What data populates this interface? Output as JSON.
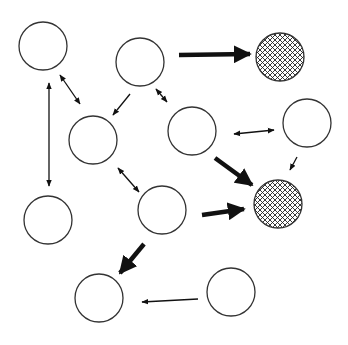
{
  "diagram": {
    "title": "",
    "colors": {
      "stroke": "#333333",
      "arrow": "#111111",
      "background": "#ffffff",
      "hatch": "#222222"
    },
    "nodes": [
      {
        "id": "A",
        "cx": 43,
        "cy": 46,
        "r": 24,
        "style": "empty"
      },
      {
        "id": "B",
        "cx": 140,
        "cy": 62,
        "r": 24,
        "style": "empty"
      },
      {
        "id": "C",
        "cx": 280,
        "cy": 57,
        "r": 24,
        "style": "hatched"
      },
      {
        "id": "D",
        "cx": 93,
        "cy": 140,
        "r": 24,
        "style": "empty"
      },
      {
        "id": "E",
        "cx": 192,
        "cy": 131,
        "r": 24,
        "style": "empty"
      },
      {
        "id": "F",
        "cx": 307,
        "cy": 123,
        "r": 24,
        "style": "empty"
      },
      {
        "id": "G",
        "cx": 278,
        "cy": 204,
        "r": 24,
        "style": "hatched"
      },
      {
        "id": "H",
        "cx": 48,
        "cy": 220,
        "r": 24,
        "style": "empty"
      },
      {
        "id": "I",
        "cx": 162,
        "cy": 210,
        "r": 24,
        "style": "empty"
      },
      {
        "id": "J",
        "cx": 99,
        "cy": 298,
        "r": 24,
        "style": "empty"
      },
      {
        "id": "K",
        "cx": 231,
        "cy": 292,
        "r": 24,
        "style": "empty"
      }
    ],
    "edges": [
      {
        "from": "A",
        "to": "D",
        "x1": 60,
        "y1": 75,
        "x2": 80,
        "y2": 104,
        "weight": "thin",
        "bidirectional": true
      },
      {
        "from": "A",
        "to": "H",
        "x1": 49,
        "y1": 83,
        "x2": 49,
        "y2": 186,
        "weight": "thin",
        "bidirectional": true
      },
      {
        "from": "B",
        "to": "D",
        "x1": 130,
        "y1": 94,
        "x2": 113,
        "y2": 115,
        "weight": "thin",
        "bidirectional": false
      },
      {
        "from": "B",
        "to": "E",
        "x1": 156,
        "y1": 89,
        "x2": 167,
        "y2": 102,
        "weight": "thin",
        "bidirectional": true
      },
      {
        "from": "B",
        "to": "C",
        "x1": 179,
        "y1": 55,
        "x2": 250,
        "y2": 54,
        "weight": "heavy",
        "bidirectional": false
      },
      {
        "from": "E",
        "to": "F",
        "x1": 234,
        "y1": 134,
        "x2": 274,
        "y2": 130,
        "weight": "thin",
        "bidirectional": true
      },
      {
        "from": "F",
        "to": "G",
        "x1": 297,
        "y1": 157,
        "x2": 290,
        "y2": 170,
        "weight": "thin",
        "bidirectional": false
      },
      {
        "from": "E",
        "to": "G",
        "x1": 215,
        "y1": 158,
        "x2": 252,
        "y2": 185,
        "weight": "heavy",
        "bidirectional": false
      },
      {
        "from": "D",
        "to": "I",
        "x1": 118,
        "y1": 168,
        "x2": 139,
        "y2": 192,
        "weight": "thin",
        "bidirectional": true
      },
      {
        "from": "I",
        "to": "G",
        "x1": 202,
        "y1": 215,
        "x2": 244,
        "y2": 209,
        "weight": "heavy",
        "bidirectional": false
      },
      {
        "from": "I",
        "to": "J",
        "x1": 144,
        "y1": 244,
        "x2": 120,
        "y2": 273,
        "weight": "heavy",
        "bidirectional": false
      },
      {
        "from": "K",
        "to": "J",
        "x1": 198,
        "y1": 299,
        "x2": 142,
        "y2": 302,
        "weight": "thin",
        "bidirectional": false
      }
    ]
  }
}
